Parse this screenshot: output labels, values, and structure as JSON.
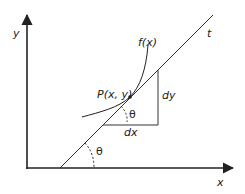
{
  "labels": {
    "y_axis": "y",
    "x_axis": "x",
    "tangent": "t",
    "function": "f(x)",
    "point": "P(x, y)",
    "dy": "dy",
    "dx": "dx",
    "theta_upper": "θ",
    "theta_lower": "θ"
  },
  "colors": {
    "stroke": "#222222",
    "background": "#ffffff"
  }
}
